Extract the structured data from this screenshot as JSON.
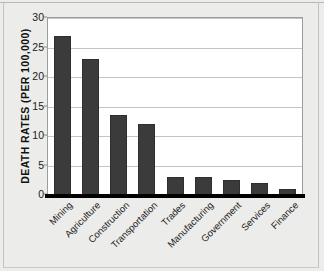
{
  "chart_data": {
    "type": "bar",
    "title": "",
    "xlabel": "",
    "ylabel": "DEATH RATES (PER 100,000)",
    "ylim": [
      0,
      30
    ],
    "yticks": [
      0,
      5,
      10,
      15,
      20,
      25,
      30
    ],
    "ytick_labels": [
      "0",
      "5",
      "10",
      "15",
      "20",
      "25",
      "30"
    ],
    "grid": true,
    "legend": "none",
    "bar_color": "#3b3b3b",
    "plot_background": "#ffffff",
    "figure_background": "#ececea",
    "categories": [
      "Mining",
      "Agriculture",
      "Construction",
      "Transportation",
      "Trades",
      "Manufacturing",
      "Government",
      "Services",
      "Finance"
    ],
    "values": [
      27,
      23,
      13.5,
      12,
      3,
      3,
      2.5,
      2,
      1
    ]
  }
}
